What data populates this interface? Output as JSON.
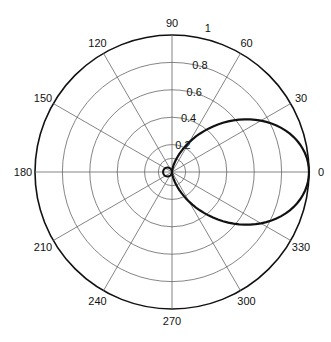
{
  "chart_data": {
    "type": "line",
    "subtype": "polar",
    "title": "",
    "radial_ticks": [
      0.2,
      0.4,
      0.6,
      0.8,
      1
    ],
    "radial_tick_labels": [
      "0.2",
      "0.4",
      "0.6",
      "0.8",
      "1"
    ],
    "angular_ticks": [
      0,
      30,
      60,
      90,
      120,
      150,
      180,
      210,
      240,
      270,
      300,
      330
    ],
    "angular_tick_labels": [
      "0",
      "30",
      "60",
      "90",
      "120",
      "150",
      "180",
      "210",
      "240",
      "270",
      "300",
      "330"
    ],
    "rlim": [
      0,
      1
    ],
    "grid": true,
    "series": [
      {
        "name": "pattern",
        "description": "main lobe along 0 deg approx r = cos^2(theta), small back lobe near origin toward 180 deg",
        "theta_deg": [
          0,
          15,
          30,
          45,
          60,
          75,
          90,
          105,
          120,
          135,
          150,
          165,
          180,
          195,
          210,
          225,
          240,
          255,
          270,
          285,
          300,
          315,
          330,
          345,
          360
        ],
        "r": [
          1.0,
          0.93,
          0.75,
          0.5,
          0.25,
          0.067,
          0.0,
          0.02,
          0.03,
          0.035,
          0.035,
          0.035,
          0.035,
          0.035,
          0.035,
          0.035,
          0.03,
          0.02,
          0.0,
          0.067,
          0.25,
          0.5,
          0.75,
          0.93,
          1.0
        ]
      }
    ]
  }
}
